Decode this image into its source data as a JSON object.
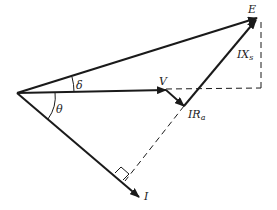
{
  "diagram": {
    "type": "phasor-diagram",
    "labels": {
      "E": "E",
      "V": "V",
      "I": "I",
      "IXs": "IX",
      "IXs_sub": "s",
      "IRa": "IR",
      "IRa_sub": "a",
      "delta": "δ",
      "theta": "θ"
    },
    "colors": {
      "line": "#1a1a1a",
      "background": "#ffffff"
    }
  }
}
